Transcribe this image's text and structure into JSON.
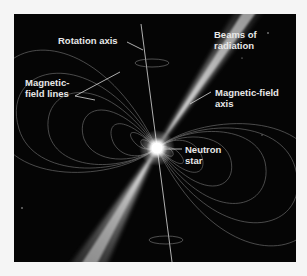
{
  "figure": {
    "background_color": "#050505",
    "page_color": "#f5f5f5",
    "label_color": "#e8e8e8"
  },
  "labels": {
    "rotation_axis": "Rotation axis",
    "beams_of_radiation_line1": "Beams of",
    "beams_of_radiation_line2": "radiation",
    "magnetic_field_lines_line1": "Magnetic-",
    "magnetic_field_lines_line2": "field lines",
    "magnetic_field_axis_line1": "Magnetic-field",
    "magnetic_field_axis_line2": "axis",
    "neutron_star_line1": "Neutron",
    "neutron_star_line2": "star"
  },
  "elements": {
    "neutron_star": {
      "x": 143,
      "y": 134
    },
    "beam_color": "#ffffff",
    "field_line_color": "#8a8a8a"
  }
}
